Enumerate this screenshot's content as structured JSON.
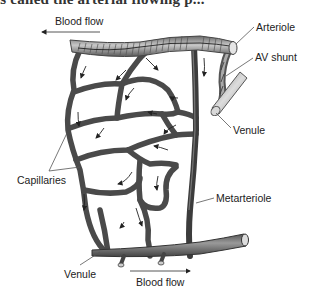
{
  "heading": {
    "text": "is called the arterial flowing p..."
  },
  "diagram": {
    "labels": {
      "blood_flow_top": "Blood flow",
      "arteriole": "Arteriole",
      "av_shunt": "AV shunt",
      "venule_right": "Venule",
      "capillaries": "Capillaries",
      "metarteriole": "Metarteriole",
      "venule_bottom": "Venule",
      "blood_flow_bottom": "Blood flow"
    },
    "arrows": {
      "blood_flow_top_direction": "left",
      "blood_flow_bottom_direction": "right"
    },
    "colors": {
      "vessel": "#4a4a4a",
      "vessel_light": "#9a9a9a",
      "text": "#222222",
      "leader_line": "#555555"
    }
  }
}
